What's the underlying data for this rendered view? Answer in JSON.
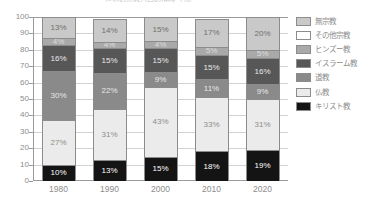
{
  "chart_data": {
    "type": "bar",
    "stacked": true,
    "title": "世界の宗教人口の推移（％）",
    "xlabel": "",
    "ylabel": "",
    "ylim": [
      0,
      100
    ],
    "yticks": [
      0,
      10,
      20,
      30,
      40,
      50,
      60,
      70,
      80,
      90,
      100
    ],
    "grid": true,
    "legend_position": "right",
    "categories": [
      "1980",
      "1990",
      "2000",
      "2010",
      "2020"
    ],
    "series": [
      {
        "name": "キリスト教",
        "color": "#141414",
        "label_color": "#ffffff",
        "values": [
          10,
          13,
          15,
          18,
          19
        ],
        "labels": [
          "10%",
          "13%",
          "15%",
          "18%",
          "19%"
        ]
      },
      {
        "name": "仏教",
        "color": "#ebebeb",
        "label_color": "#8d8d8d",
        "values": [
          27,
          31,
          43,
          33,
          31
        ],
        "labels": [
          "27%",
          "31%",
          "43%",
          "33%",
          "31%"
        ]
      },
      {
        "name": "道教",
        "color": "#8a8a8a",
        "label_color": "#e8e8e8",
        "values": [
          30,
          22,
          9,
          11,
          9
        ],
        "labels": [
          "30%",
          "22%",
          "9%",
          "11%",
          "9%"
        ]
      },
      {
        "name": "イスラーム教",
        "color": "#575757",
        "label_color": "#e8e8e8",
        "values": [
          16,
          15,
          15,
          15,
          16
        ],
        "labels": [
          "16%",
          "15%",
          "15%",
          "15%",
          "16%"
        ]
      },
      {
        "name": "ヒンズー教",
        "color": "#a9a9a9",
        "label_color": "#dedede",
        "values": [
          4,
          4,
          4,
          5,
          5
        ],
        "labels": [
          "4%",
          "4%",
          "4%",
          "5%",
          "5%"
        ]
      },
      {
        "name": "その他宗教",
        "color": "#ffffff",
        "label_color": "#9a9a9a",
        "values": [
          0,
          0,
          0,
          0,
          0
        ],
        "labels": [
          "",
          "",
          "",
          "",
          ""
        ]
      },
      {
        "name": "無宗教",
        "color": "#c9c9c9",
        "label_color": "#6f6f6f",
        "values": [
          13,
          14,
          15,
          17,
          20
        ],
        "labels": [
          "13%",
          "14%",
          "15%",
          "17%",
          "20%"
        ]
      }
    ],
    "legend_entries": [
      {
        "label": "無宗教",
        "color": "#c9c9c9"
      },
      {
        "label": "その他宗教",
        "color": "#ffffff"
      },
      {
        "label": "ヒンズー教",
        "color": "#a9a9a9"
      },
      {
        "label": "イスラーム教",
        "color": "#575757"
      },
      {
        "label": "道教",
        "color": "#8a8a8a"
      },
      {
        "label": "仏教",
        "color": "#ebebeb"
      },
      {
        "label": "キリスト教",
        "color": "#141414"
      }
    ]
  }
}
